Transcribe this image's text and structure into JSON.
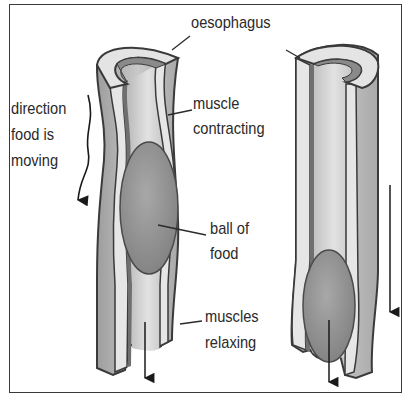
{
  "diagram": {
    "labels": {
      "oesophagus": "oesophagus",
      "direction_line1": "direction",
      "direction_line2": "food is",
      "direction_line3": "moving",
      "muscle_contracting_line1": "muscle",
      "muscle_contracting_line2": "contracting",
      "ball_of_food_line1": "ball of",
      "ball_of_food_line2": "food",
      "muscles_relaxing_line1": "muscles",
      "muscles_relaxing_line2": "relaxing"
    },
    "colors": {
      "outer_wall": "#b9b9b9",
      "muscle_layer": "#e4e4e4",
      "inner_lining": "#8a8a8a",
      "lumen": "#cfcfcf",
      "food_ball": "#9a9a9a",
      "outline": "#3a3a3a"
    }
  }
}
